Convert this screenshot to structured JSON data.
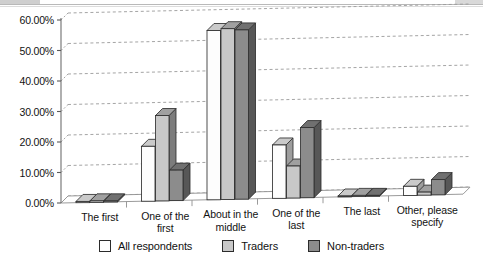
{
  "chart_data": {
    "type": "bar",
    "title": "",
    "subtitle": "",
    "xlabel": "",
    "ylabel": "",
    "ylim": [
      0,
      60
    ],
    "ytick_step": 10,
    "ytick_labels": [
      "0.00%",
      "10.00%",
      "20.00%",
      "30.00%",
      "40.00%",
      "50.00%",
      "60.00%"
    ],
    "ytick_values": [
      0,
      10,
      20,
      30,
      40,
      50,
      60
    ],
    "grid": true,
    "grid_style": "dashed-horizontal",
    "three_d": true,
    "legend_position": "bottom",
    "categories": [
      "The first",
      "One of the first",
      "About in the middle",
      "One of the last",
      "The last",
      "Other, please specify"
    ],
    "series": [
      {
        "name": "All respondents",
        "color": "#fdfdfd",
        "values": [
          0.4,
          18.0,
          55.5,
          17.5,
          0.3,
          3.0
        ]
      },
      {
        "name": "Traders",
        "color": "#c8c8c8",
        "values": [
          0.5,
          28.0,
          56.0,
          10.5,
          0.4,
          1.0
        ]
      },
      {
        "name": "Non-traders",
        "color": "#8c8c8c",
        "values": [
          0.4,
          10.0,
          55.5,
          23.0,
          0.3,
          5.0
        ]
      }
    ]
  },
  "legend": {
    "items": [
      {
        "label": "All respondents",
        "color": "#fdfdfd"
      },
      {
        "label": "Traders",
        "color": "#c8c8c8"
      },
      {
        "label": "Non-traders",
        "color": "#8c8c8c"
      }
    ]
  },
  "axis": {
    "y_labels": [
      "60.00%",
      "50.00%",
      "40.00%",
      "30.00%",
      "20.00%",
      "10.00%",
      "0.00%"
    ]
  },
  "x_labels": [
    {
      "line1": "The first",
      "line2": ""
    },
    {
      "line1": "One of the",
      "line2": "first"
    },
    {
      "line1": "About in the",
      "line2": "middle"
    },
    {
      "line1": "One of the",
      "line2": "last"
    },
    {
      "line1": "The last",
      "line2": ""
    },
    {
      "line1": "Other, please",
      "line2": "specify"
    }
  ]
}
